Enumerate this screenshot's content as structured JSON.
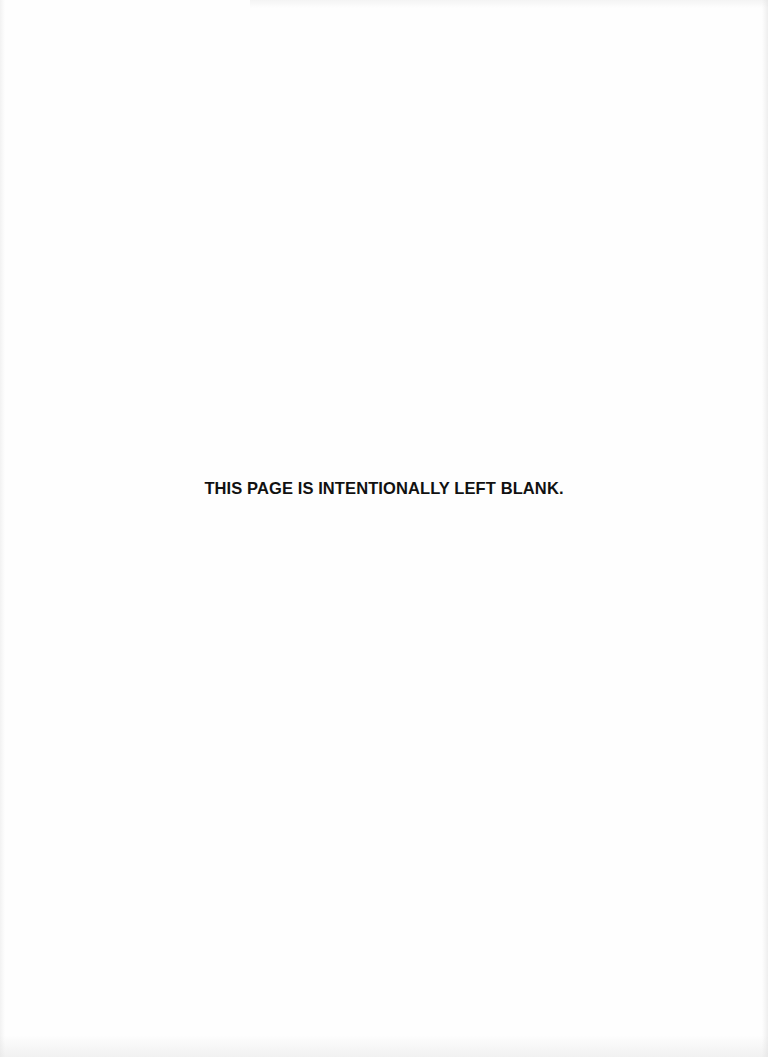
{
  "page": {
    "notice": "THIS PAGE IS INTENTIONALLY LEFT BLANK.",
    "background_color": "#fefefe",
    "text_color": "#111111"
  }
}
